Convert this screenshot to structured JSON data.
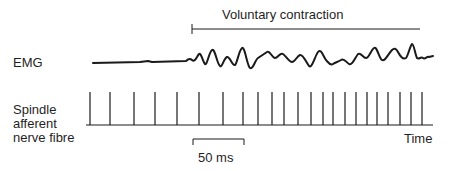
{
  "labels": {
    "contraction": "Voluntary contraction",
    "emg": "EMG",
    "spindle_line1": "Spindle",
    "spindle_line2": "afferent",
    "spindle_line3": "nerve fibre",
    "time": "Time",
    "scale": "50 ms"
  },
  "colors": {
    "ink": "#1a1a1a",
    "background": "#ffffff"
  },
  "contraction_bar": {
    "x_start": 192,
    "x_end": 420,
    "y": 29
  },
  "scale_bar": {
    "x_start": 193,
    "x_end": 244,
    "y": 139,
    "duration_ms": 50
  },
  "emg_trace": {
    "baseline_y": 63,
    "x_start": 93,
    "x_end": 433,
    "onset_x": 186
  },
  "spike_train": {
    "baseline_y": 125,
    "spike_top_y": 92,
    "x_start": 86,
    "x_end": 433,
    "spike_x": [
      90,
      110,
      134,
      155,
      177,
      199,
      223,
      243,
      258,
      272,
      284,
      298,
      311,
      323,
      333,
      345,
      356,
      367,
      377,
      388,
      400,
      411,
      422
    ]
  }
}
